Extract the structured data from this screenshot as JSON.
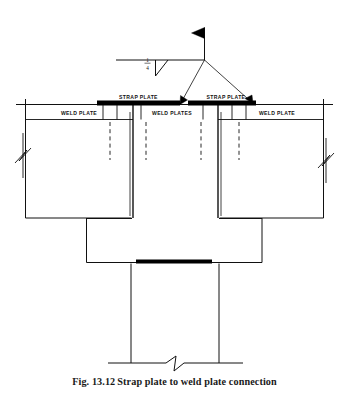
{
  "figure": {
    "caption_number": "Fig. 13.12",
    "caption_text": "Strap plate to weld plate connection",
    "title": "Strap plate to weld plate connection",
    "background_color": "#ffffff",
    "line_color": "#111111",
    "fill_color": "#000000"
  },
  "weld_symbol": {
    "name": "field-fillet-weld-symbol",
    "size_numerator": "1",
    "size_denominator": "4",
    "size_text": "1/4",
    "weld_type": "fillet",
    "field_weld_flag": true,
    "leader_arrow_count": 2,
    "tail": false
  },
  "labels": {
    "strap_plate_left": "STRAP PLATE",
    "strap_plate_right": "STRAP PLATE",
    "weld_plate_left": "WELD PLATE",
    "weld_plates_middle": "WELD PLATES",
    "weld_plate_right": "WELD PLATE"
  },
  "annotations": {
    "break_line_left": "break-line",
    "break_line_right": "break-line",
    "break_line_bottom": "break-line"
  },
  "members": {
    "slab_left": "precast-slab-left",
    "slab_right": "precast-slab-right",
    "beam": "supporting-beam",
    "column": "column"
  }
}
